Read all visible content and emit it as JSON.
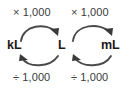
{
  "diagram": {
    "type": "unit-conversion-flow",
    "background_color": "#ffffff",
    "text_color": "#1a1a1a",
    "arrow_color": "#4a4a4a",
    "units": [
      {
        "id": "kilolitre",
        "label": "kL"
      },
      {
        "id": "litre",
        "label": "L"
      },
      {
        "id": "millilitre",
        "label": "mL"
      }
    ],
    "operations": {
      "multiply_left": "× 1,000",
      "multiply_right": "× 1,000",
      "divide_left": "÷ 1,000",
      "divide_right": "÷ 1,000"
    },
    "arrows": [
      {
        "id": "kl-to-l",
        "from": "kL",
        "to": "L",
        "direction": "right",
        "position": "top",
        "operation": "× 1,000"
      },
      {
        "id": "l-to-ml",
        "from": "L",
        "to": "mL",
        "direction": "right",
        "position": "top",
        "operation": "× 1,000"
      },
      {
        "id": "l-to-kl",
        "from": "L",
        "to": "kL",
        "direction": "left",
        "position": "bottom",
        "operation": "÷ 1,000"
      },
      {
        "id": "ml-to-l",
        "from": "mL",
        "to": "L",
        "direction": "left",
        "position": "bottom",
        "operation": "÷ 1,000"
      }
    ]
  }
}
